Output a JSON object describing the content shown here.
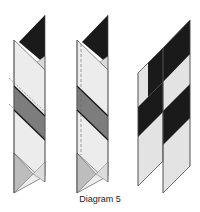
{
  "caption": "Diagram 5",
  "colors": {
    "black": "#1a1a1a",
    "dark_gray": "#7a7a7a",
    "mid_gray": "#b9b9b9",
    "light_gray": "#e6e6e6",
    "outline": "#555555"
  },
  "figures": [
    {
      "id": "step-1",
      "description": "Folded strip with black top triangle, dark gray diagonal band and dashed fold lines"
    },
    {
      "id": "step-2",
      "description": "Same folded strip with vertical dashed seam line"
    },
    {
      "id": "step-3",
      "description": "Two joined parallelogram strips with alternating black and light diagonal bands"
    }
  ]
}
